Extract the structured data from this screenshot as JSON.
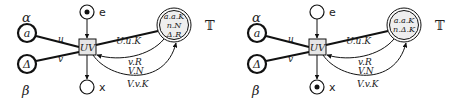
{
  "diagrams": [
    {
      "id": "left",
      "places": {
        "alpha_label": "α",
        "beta_label": "β",
        "a_token": "a",
        "delta_token": "Δ",
        "e_label": "e",
        "x_label": "x",
        "T_label": "𝕋",
        "T_lines": [
          "a.a.K",
          "n.N",
          "Δ.R"
        ],
        "e_marked": true,
        "x_marked": false
      },
      "transition": {
        "label": "UV"
      },
      "arcs": {
        "u": "u",
        "v": "v",
        "out": "U.u.K",
        "in1": "v.R",
        "in2": "V.N",
        "in3": "V.v.K"
      }
    },
    {
      "id": "right",
      "places": {
        "alpha_label": "α",
        "beta_label": "β",
        "a_token": "a",
        "delta_token": "Δ",
        "e_label": "e",
        "x_label": "x",
        "T_label": "𝕋",
        "T_lines": [
          "a.a.K",
          "n.Δ.K"
        ],
        "e_marked": false,
        "x_marked": true
      },
      "transition": {
        "label": "UV"
      },
      "arcs": {
        "u": "u",
        "v": "v",
        "out": "U.u.K",
        "in1": "v.R",
        "in2": "V.N",
        "in3": "V.v.K"
      }
    }
  ],
  "colors": {
    "stroke": "#111111",
    "transition_fill": "#e6e6e6",
    "T_fill": "#eeeeee",
    "label_grey": "#555555"
  }
}
